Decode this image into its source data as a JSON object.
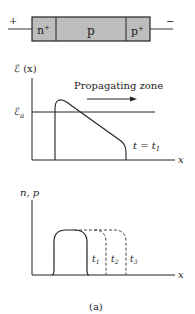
{
  "device": {
    "terminal_left": "+",
    "terminal_right": "−",
    "regions": [
      {
        "label": "n",
        "sup": "+"
      },
      {
        "label": "p",
        "sup": ""
      },
      {
        "label": "p",
        "sup": "+"
      }
    ],
    "fill_color": "#bdbdbd"
  },
  "field_plot": {
    "ylabel": "ℰ (x)",
    "threshold_label": "ℰ",
    "threshold_sub": "a",
    "annotation": "Propagating zone",
    "time_label": "t = t",
    "time_sub": "1",
    "xlabel": "x"
  },
  "carrier_plot": {
    "ylabel": "n, p",
    "xlabel": "x",
    "time_labels": [
      {
        "t": "t",
        "sub": "1"
      },
      {
        "t": "t",
        "sub": "2"
      },
      {
        "t": "t",
        "sub": "3"
      }
    ]
  },
  "caption": "(a)"
}
